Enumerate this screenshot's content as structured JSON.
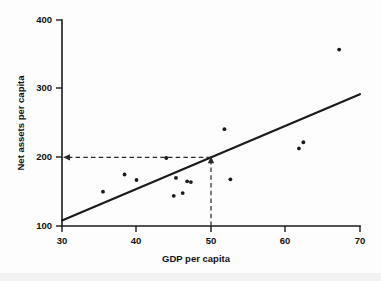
{
  "chart_data": {
    "type": "scatter",
    "title": "",
    "xlabel": "GDP per capita",
    "ylabel": "Net assets per capita",
    "xlim": [
      30,
      70
    ],
    "ylim": [
      100,
      400
    ],
    "xticks": [
      30,
      40,
      50,
      60,
      70
    ],
    "yticks": [
      100,
      200,
      300,
      400
    ],
    "xtick_labels": [
      "30",
      "40",
      "50",
      "60",
      "70"
    ],
    "ytick_labels": [
      "100",
      "200",
      "300",
      "400"
    ],
    "grid": false,
    "legend": "none",
    "points": [
      {
        "x": 35.5,
        "y": 150
      },
      {
        "x": 38.4,
        "y": 175
      },
      {
        "x": 40.0,
        "y": 167
      },
      {
        "x": 44.0,
        "y": 199
      },
      {
        "x": 45.0,
        "y": 144
      },
      {
        "x": 45.3,
        "y": 170
      },
      {
        "x": 46.2,
        "y": 148
      },
      {
        "x": 46.8,
        "y": 165
      },
      {
        "x": 47.3,
        "y": 164
      },
      {
        "x": 51.8,
        "y": 241
      },
      {
        "x": 52.6,
        "y": 168
      },
      {
        "x": 61.8,
        "y": 213
      },
      {
        "x": 62.4,
        "y": 222
      },
      {
        "x": 67.2,
        "y": 357
      }
    ],
    "trend_line": {
      "name": "regression line",
      "x_start": 30,
      "y_start": 108,
      "x_end": 70,
      "y_end": 292
    },
    "annotation": {
      "name": "prediction-guide",
      "x_value": 50,
      "y_value": 200,
      "style": "dashed with arrowheads",
      "vertical_from_axis_to_line": true,
      "horizontal_from_line_to_axis": true
    }
  },
  "axes": {
    "x_title": "GDP per capita",
    "y_title": "Net assets per capita",
    "x_tick_0": "30",
    "x_tick_1": "40",
    "x_tick_2": "50",
    "x_tick_3": "60",
    "x_tick_4": "70",
    "y_tick_0": "100",
    "y_tick_1": "200",
    "y_tick_2": "300",
    "y_tick_3": "400"
  },
  "colors": {
    "ink": "#1a1a1a",
    "background": "#fdfdfd",
    "guide": "#2b2b2b"
  }
}
